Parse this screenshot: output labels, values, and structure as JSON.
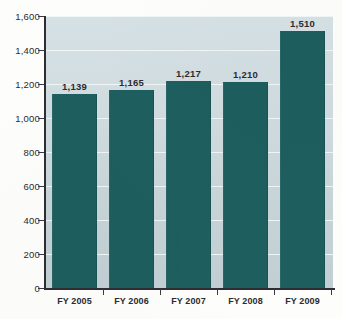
{
  "chart_data": {
    "type": "bar",
    "title": "",
    "subtitle": "",
    "xlabel": "",
    "ylabel": "",
    "categories": [
      "FY 2005",
      "FY 2006",
      "FY 2007",
      "FY 2008",
      "FY 2009"
    ],
    "values": [
      1139,
      1165,
      1217,
      1210,
      1510
    ],
    "value_labels": [
      "1,139",
      "1,165",
      "1,217",
      "1,210",
      "1,510"
    ],
    "ylim": [
      0,
      1600
    ],
    "ytick_values": [
      0,
      200,
      400,
      600,
      800,
      1000,
      1200,
      1400,
      1600
    ],
    "ytick_labels": [
      "0",
      "200",
      "400",
      "600",
      "800",
      "1,000",
      "1,200",
      "1,400",
      "1,600"
    ],
    "grid": true,
    "grid_axis": "y",
    "legend": false,
    "legend_position": "none",
    "series": [
      {
        "name": "",
        "values": [
          1139,
          1165,
          1217,
          1210,
          1510
        ]
      }
    ]
  },
  "colors": {
    "bar": "#1e5e5e",
    "plot_background_top": "#d6e1e5",
    "plot_background_bottom": "#c1cfd4",
    "gridline": "#f1f6f7",
    "axis": "#2d2d33",
    "text": "#2b2b31",
    "page_background": "#fdfdfc"
  }
}
